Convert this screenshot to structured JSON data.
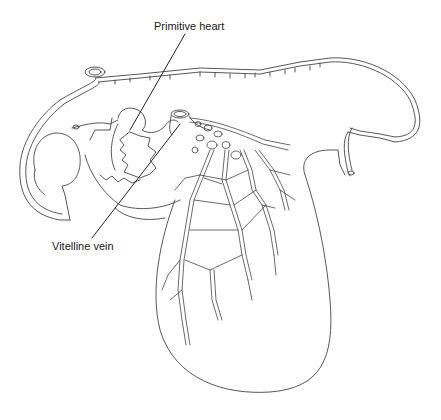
{
  "diagram": {
    "labels": [
      {
        "id": "primitive-heart",
        "text": "Primitive heart"
      },
      {
        "id": "vitelline-vein",
        "text": "Vitelline vein"
      }
    ],
    "caption_partial": "FIGURE 2-3 ... (caption cut off)"
  }
}
